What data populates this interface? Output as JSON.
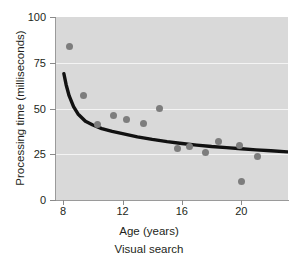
{
  "chart_data": {
    "type": "scatter",
    "title": "",
    "caption": "Visual search",
    "xlabel": "Age (years)",
    "ylabel": "Processing time (milliseconds)",
    "xlim": [
      7.45,
      23.15
    ],
    "ylim": [
      0,
      100
    ],
    "xticks": [
      8,
      12,
      16,
      20
    ],
    "yticks": [
      0,
      25,
      50,
      75,
      100
    ],
    "xtick_labels": [
      "8",
      "12",
      "16",
      "20"
    ],
    "ytick_labels": [
      "0",
      "25",
      "50",
      "75",
      "100"
    ],
    "grid": "horizontal",
    "gridlines_at": [
      25,
      50,
      75
    ],
    "legend": "none",
    "point_color": "#7d7d7d",
    "curve_color": "#111111",
    "plot_background": "#d9d9d9",
    "page_background": "#ffffff",
    "points": [
      {
        "x": 8.4,
        "y": 84
      },
      {
        "x": 9.4,
        "y": 57
      },
      {
        "x": 10.3,
        "y": 41
      },
      {
        "x": 11.4,
        "y": 46
      },
      {
        "x": 12.3,
        "y": 44
      },
      {
        "x": 13.4,
        "y": 42
      },
      {
        "x": 14.5,
        "y": 50
      },
      {
        "x": 15.7,
        "y": 28
      },
      {
        "x": 16.5,
        "y": 29
      },
      {
        "x": 17.6,
        "y": 26
      },
      {
        "x": 18.5,
        "y": 32
      },
      {
        "x": 19.9,
        "y": 30
      },
      {
        "x": 20.0,
        "y": 10
      },
      {
        "x": 21.1,
        "y": 24
      }
    ],
    "curve": {
      "description": "decreasing power-law fit",
      "x": [
        8.05,
        8.2,
        8.4,
        8.7,
        9.0,
        9.5,
        10.0,
        10.6,
        11.3,
        12.0,
        13.0,
        14.0,
        15.0,
        16.0,
        17.0,
        18.0,
        19.0,
        20.0,
        21.0,
        22.0,
        23.1
      ],
      "y": [
        69,
        63,
        57,
        51,
        47,
        43,
        41,
        39,
        37.5,
        36.3,
        34.5,
        33.1,
        31.9,
        30.9,
        30.0,
        29.2,
        28.6,
        28.0,
        27.4,
        26.9,
        26.3
      ]
    }
  }
}
